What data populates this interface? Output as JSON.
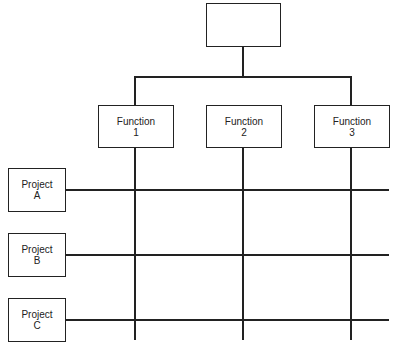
{
  "diagram": {
    "type": "matrix-organization-chart",
    "top_box": {
      "label": ""
    },
    "functions": [
      {
        "line1": "Function",
        "line2": "1"
      },
      {
        "line1": "Function",
        "line2": "2"
      },
      {
        "line1": "Function",
        "line2": "3"
      }
    ],
    "projects": [
      {
        "line1": "Project",
        "line2": "A"
      },
      {
        "line1": "Project",
        "line2": "B"
      },
      {
        "line1": "Project",
        "line2": "C"
      }
    ]
  }
}
